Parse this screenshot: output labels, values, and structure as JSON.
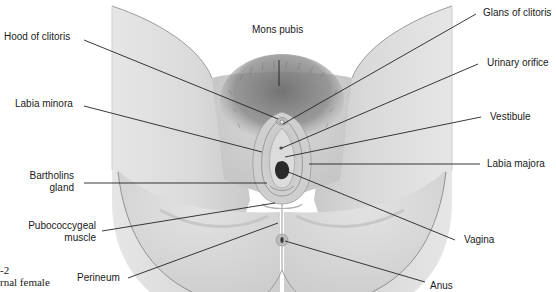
{
  "figure": {
    "caption_number": "-2",
    "caption_text": "rnal female"
  },
  "labels": {
    "hood_of_clitoris": "Hood of clitoris",
    "mons_pubis": "Mons pubis",
    "glans_of_clitoris": "Glans of clitoris",
    "urinary_orifice": "Urinary orifice",
    "labia_minora": "Labia minora",
    "vestibule": "Vestibule",
    "bartholins_gland_line1": "Bartholins",
    "bartholins_gland_line2": "gland",
    "labia_majora": "Labia majora",
    "pubococcygeal_muscle_line1": "Pubococcygeal",
    "pubococcygeal_muscle_line2": "muscle",
    "vagina": "Vagina",
    "perineum": "Perineum",
    "anus": "Anus"
  },
  "colors": {
    "skin_light": "#e4e4e4",
    "skin_mid": "#cfcfcf",
    "skin_dark": "#a9a9a9",
    "hair": "#7a7a7a",
    "opening": "#2a2a2a",
    "leader_line": "#222222",
    "background": "#ffffff"
  }
}
